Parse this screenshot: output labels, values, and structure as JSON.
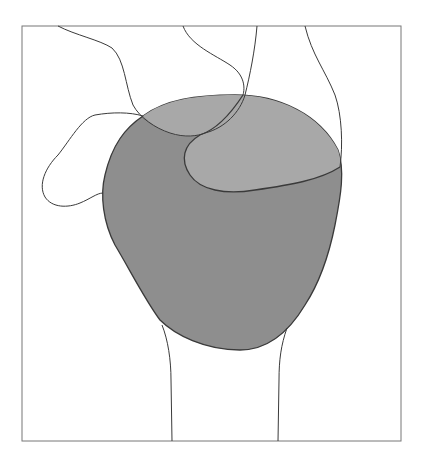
{
  "diagram": {
    "type": "anatomical-line-illustration",
    "labels": [],
    "colors": {
      "background": "#ffffff",
      "frame_stroke": "#777777",
      "outline_stroke": "#3a3a3a",
      "main_region_fill": "#8e8e8e",
      "overlap_region_fill": "#a8a8a8"
    },
    "regions": [
      {
        "name": "main-shaded-region",
        "shade": "dark grey"
      },
      {
        "name": "upper-overlap-region",
        "shade": "light grey"
      }
    ]
  }
}
